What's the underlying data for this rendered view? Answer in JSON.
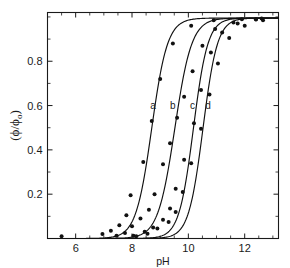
{
  "chart_data": {
    "type": "line",
    "title": "",
    "subtitle": "",
    "xlabel": "pH",
    "ylabel": "( ϕ / ϕₒ )",
    "ylabel_parts": {
      "open": "(",
      "phi": "ϕ",
      "slash": "/",
      "phi_sub": "ϕ",
      "sub": "o",
      "close": ")"
    },
    "xlim": [
      5.0,
      13.2
    ],
    "ylim": [
      0.0,
      1.02
    ],
    "xticks": [
      6,
      8,
      10,
      12
    ],
    "xticklabels": [
      "6",
      "8",
      "10",
      "12"
    ],
    "xticks_minor": [
      5.5,
      6.5,
      7,
      7.5,
      8.5,
      9,
      9.5,
      10.5,
      11,
      11.5,
      12.5,
      13
    ],
    "yticks": [
      0.2,
      0.4,
      0.6,
      0.8
    ],
    "yticklabels": [
      "0.2",
      "0.4",
      "0.6",
      "0.8"
    ],
    "yticks_minor": [
      0.1,
      0.3,
      0.5,
      0.7,
      0.9,
      1.0
    ],
    "grid": false,
    "legend_position": "inline-curve-labels",
    "marker_style": "filled-circle",
    "marker_color": "#111111",
    "line_color": "#111111",
    "background": "#ffffff",
    "series": [
      {
        "name": "a",
        "label": "a",
        "label_x": 8.75,
        "label_y": 0.6,
        "midpoint_pH": 8.7,
        "slope": 1.55,
        "points": [
          {
            "x": 5.5,
            "y": 0.01
          },
          {
            "x": 6.95,
            "y": 0.02
          },
          {
            "x": 7.25,
            "y": 0.035
          },
          {
            "x": 7.55,
            "y": 0.06
          },
          {
            "x": 7.8,
            "y": 0.105
          },
          {
            "x": 7.95,
            "y": 0.195
          },
          {
            "x": 8.4,
            "y": 0.345
          },
          {
            "x": 8.7,
            "y": 0.53
          },
          {
            "x": 9.0,
            "y": 0.72
          },
          {
            "x": 9.45,
            "y": 0.88
          },
          {
            "x": 10.1,
            "y": 0.96
          },
          {
            "x": 10.9,
            "y": 0.985
          },
          {
            "x": 11.9,
            "y": 0.99
          },
          {
            "x": 12.6,
            "y": 0.993
          }
        ]
      },
      {
        "name": "b",
        "label": "b",
        "label_x": 9.45,
        "label_y": 0.6,
        "midpoint_pH": 9.52,
        "slope": 1.45,
        "points": [
          {
            "x": 7.45,
            "y": 0.012
          },
          {
            "x": 7.75,
            "y": 0.025
          },
          {
            "x": 8.0,
            "y": 0.055
          },
          {
            "x": 8.3,
            "y": 0.09
          },
          {
            "x": 8.6,
            "y": 0.13
          },
          {
            "x": 8.8,
            "y": 0.2
          },
          {
            "x": 9.1,
            "y": 0.335
          },
          {
            "x": 9.35,
            "y": 0.43
          },
          {
            "x": 9.6,
            "y": 0.545
          },
          {
            "x": 9.85,
            "y": 0.64
          },
          {
            "x": 10.15,
            "y": 0.755
          },
          {
            "x": 10.5,
            "y": 0.87
          },
          {
            "x": 10.95,
            "y": 0.945
          },
          {
            "x": 11.6,
            "y": 0.975
          },
          {
            "x": 12.4,
            "y": 0.99
          }
        ]
      },
      {
        "name": "c",
        "label": "c",
        "label_x": 10.15,
        "label_y": 0.6,
        "midpoint_pH": 10.18,
        "slope": 1.7,
        "points": [
          {
            "x": 8.05,
            "y": 0.012
          },
          {
            "x": 8.45,
            "y": 0.03
          },
          {
            "x": 8.75,
            "y": 0.05
          },
          {
            "x": 9.1,
            "y": 0.085
          },
          {
            "x": 9.35,
            "y": 0.135
          },
          {
            "x": 9.55,
            "y": 0.225
          },
          {
            "x": 9.85,
            "y": 0.355
          },
          {
            "x": 10.2,
            "y": 0.52
          },
          {
            "x": 10.45,
            "y": 0.67
          },
          {
            "x": 10.8,
            "y": 0.84
          },
          {
            "x": 11.2,
            "y": 0.93
          },
          {
            "x": 11.75,
            "y": 0.97
          },
          {
            "x": 12.4,
            "y": 0.988
          }
        ]
      },
      {
        "name": "d",
        "label": "d",
        "label_x": 10.7,
        "label_y": 0.6,
        "midpoint_pH": 10.52,
        "slope": 1.7,
        "points": [
          {
            "x": 8.15,
            "y": 0.01
          },
          {
            "x": 8.55,
            "y": 0.022
          },
          {
            "x": 8.9,
            "y": 0.045
          },
          {
            "x": 9.3,
            "y": 0.075
          },
          {
            "x": 9.55,
            "y": 0.12
          },
          {
            "x": 9.8,
            "y": 0.21
          },
          {
            "x": 10.1,
            "y": 0.34
          },
          {
            "x": 10.45,
            "y": 0.495
          },
          {
            "x": 10.75,
            "y": 0.65
          },
          {
            "x": 11.05,
            "y": 0.79
          },
          {
            "x": 11.45,
            "y": 0.905
          },
          {
            "x": 12.0,
            "y": 0.96
          },
          {
            "x": 12.65,
            "y": 0.985
          }
        ]
      }
    ]
  }
}
